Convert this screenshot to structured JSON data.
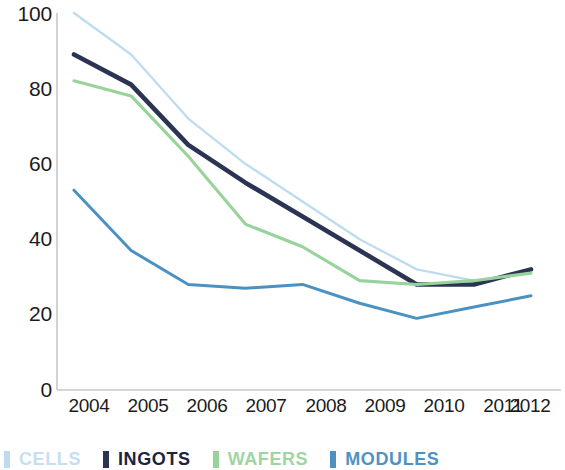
{
  "chart_data": {
    "type": "line",
    "title": "",
    "subtitle": "",
    "xlabel": "",
    "ylabel": "",
    "categories": [
      "2004",
      "2005",
      "2006",
      "2007",
      "2008",
      "2009",
      "2010",
      "2011",
      "2012"
    ],
    "x": [
      2004,
      2005,
      2006,
      2007,
      2008,
      2009,
      2010,
      2011,
      2012
    ],
    "ylim": [
      0,
      100
    ],
    "yticks": [
      0,
      20,
      40,
      60,
      80,
      100
    ],
    "ytick_labels": [
      "0",
      "20",
      "40",
      "60",
      "80",
      "100"
    ],
    "grid": false,
    "legend_position": "bottom-left",
    "series": [
      {
        "name": "CELLS",
        "color": "#bedcf0",
        "values": [
          100,
          89,
          72,
          60,
          50,
          40,
          32,
          29,
          31
        ]
      },
      {
        "name": "INGOTS",
        "color": "#2b3553",
        "values": [
          89,
          81,
          65,
          55,
          46,
          37,
          28,
          28,
          32
        ]
      },
      {
        "name": "WAFERS",
        "color": "#98d39c",
        "values": [
          82,
          78,
          62,
          44,
          38,
          29,
          28,
          29,
          31
        ]
      },
      {
        "name": "MODULES",
        "color": "#4b92c3",
        "values": [
          53,
          37,
          28,
          27,
          28,
          23,
          19,
          22,
          25
        ]
      }
    ]
  },
  "axis": {
    "color": "#c9c9c9",
    "tick_text_color": "#1c1c1c"
  },
  "legend": {
    "items": [
      {
        "label": "CELLS",
        "color": "#bedcf0",
        "text_color": "#c5dff1"
      },
      {
        "label": "INGOTS",
        "color": "#2b3553",
        "text_color": "#1c2440"
      },
      {
        "label": "WAFERS",
        "color": "#98d39c",
        "text_color": "#9fd5a3"
      },
      {
        "label": "MODULES",
        "color": "#4b92c3",
        "text_color": "#4f92c1"
      }
    ]
  }
}
